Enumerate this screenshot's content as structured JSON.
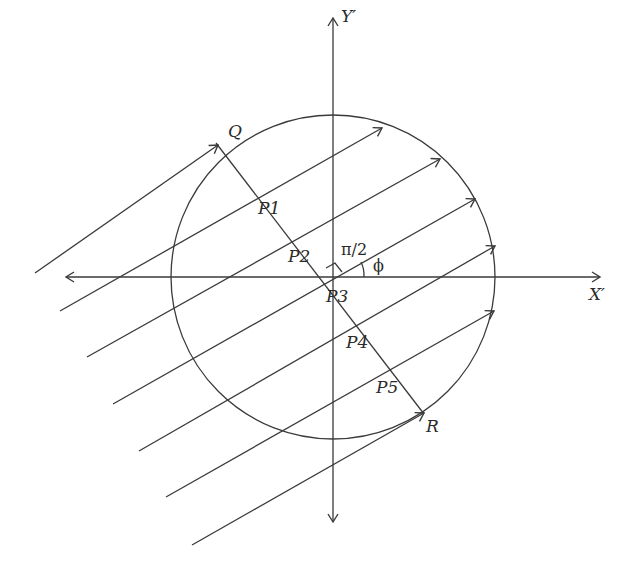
{
  "diagram": {
    "type": "geometric-projection",
    "colors": {
      "line": "#3a3a3a",
      "text": "#2a2a2a",
      "background": "#ffffff"
    },
    "axes": {
      "x_label": "X′",
      "y_label": "Y′"
    },
    "circle": {
      "cx": 333,
      "cy": 277,
      "r": 162
    },
    "points": {
      "Q": "Q",
      "R": "R",
      "P1": "P1",
      "P2": "P2",
      "P3": "P3",
      "P4": "P4",
      "P5": "P5"
    },
    "angles": {
      "right_angle": "π/2",
      "phi": "ϕ"
    },
    "parallel_ray_count": 7,
    "ray_angle_deg": 28
  }
}
